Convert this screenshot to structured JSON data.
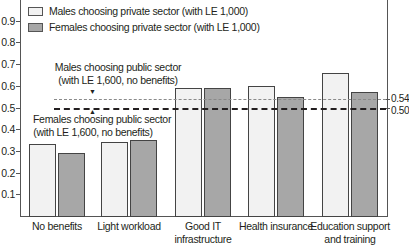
{
  "chart_data": {
    "type": "bar",
    "title": "",
    "xlabel": "",
    "ylabel": "",
    "ylim": [
      0,
      1.0
    ],
    "yticks": [
      "0.1",
      "0.2",
      "0.3",
      "0.4",
      "0.5",
      "0.6",
      "0.7",
      "0.8",
      "0.9"
    ],
    "grid": false,
    "legend_position": "top-left",
    "categories": [
      "No benefits",
      "Light workload",
      "Good IT infrastructure",
      "Health insurance",
      "Education support and training"
    ],
    "category_labels": [
      [
        "No benefits"
      ],
      [
        "Light workload"
      ],
      [
        "Good IT",
        "infrastructure"
      ],
      [
        "Health insurance"
      ],
      [
        "Education support",
        "and training"
      ]
    ],
    "series": [
      {
        "name": "Males choosing private sector (with LE 1,000)",
        "color": "#f2f2f2",
        "values": [
          0.33,
          0.34,
          0.59,
          0.6,
          0.66
        ]
      },
      {
        "name": "Females choosing private sector (with LE 1,000)",
        "color": "#a7a7a7",
        "values": [
          0.29,
          0.35,
          0.59,
          0.55,
          0.57
        ]
      }
    ],
    "reference_lines": [
      {
        "name": "Males choosing public sector (with LE 1,600, no benefits)",
        "value": 0.54,
        "label": "0.54",
        "style": "dashed-gray",
        "annotation": [
          "Males choosing public sector",
          "(with LE 1,600, no benefits)"
        ]
      },
      {
        "name": "Females choosing public sector (with LE 1,600, no benefits)",
        "value": 0.5,
        "label": "0.50",
        "style": "dashed-black",
        "annotation": [
          "Females choosing public sector",
          "(with LE 1,600, no benefits)"
        ]
      }
    ]
  }
}
